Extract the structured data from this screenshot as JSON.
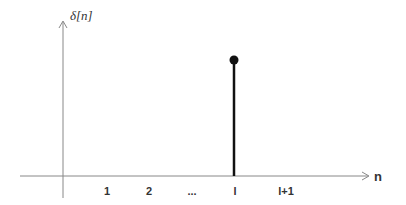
{
  "diagram": {
    "title": "",
    "y_axis_label": "δ[n]",
    "x_axis_label": "n",
    "x_ticks": [
      "1",
      "2",
      "...",
      "l",
      "l+1"
    ],
    "impulse_position_label": "l",
    "colors": {
      "axis": "#888888",
      "stem": "#111111",
      "text": "#333333"
    }
  }
}
